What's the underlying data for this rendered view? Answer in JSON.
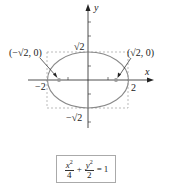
{
  "diagram": {
    "axes": {
      "x_label": "x",
      "y_label": "y"
    },
    "ticks": {
      "x_neg": "−2",
      "x_pos": "2",
      "y_pos": "√2",
      "y_neg": "−√2"
    },
    "foci": {
      "left": "(−√2, 0)",
      "right": "(√2, 0)"
    },
    "colors": {
      "ellipse": "#8a8a8a",
      "focus": "#9a9a9a",
      "axis": "#222222",
      "dashed": "#aaaaaa"
    }
  },
  "equation": {
    "x_num": "x",
    "x_den": "4",
    "y_num": "y",
    "y_den": "2",
    "exp": "2",
    "plus": "+",
    "equals": "=",
    "rhs": "1"
  }
}
